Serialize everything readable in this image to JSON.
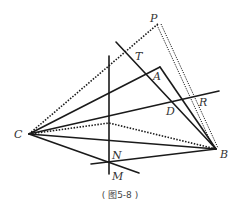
{
  "figure": {
    "caption": "( 图5-8 )",
    "points": {
      "P": {
        "label": "P",
        "x": 159,
        "y": 23
      },
      "T": {
        "label": "T",
        "x": 132,
        "y": 53
      },
      "A": {
        "label": "A",
        "x": 160,
        "y": 67
      },
      "D": {
        "label": "D",
        "x": 172,
        "y": 100
      },
      "R": {
        "label": "R",
        "x": 193,
        "y": 97
      },
      "C": {
        "label": "C",
        "x": 29,
        "y": 134
      },
      "B": {
        "label": "B",
        "x": 216,
        "y": 149
      },
      "N": {
        "label": "N",
        "x": 109,
        "y": 140
      },
      "M": {
        "label": "M",
        "x": 109,
        "y": 163
      }
    }
  }
}
